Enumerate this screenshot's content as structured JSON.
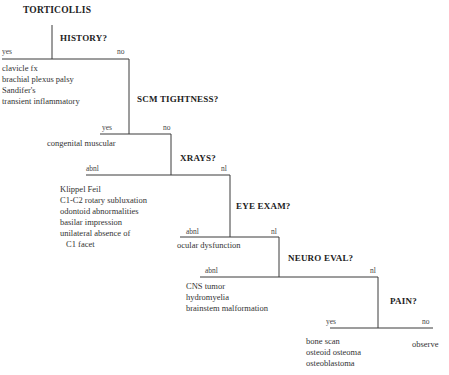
{
  "title": "TORTICOLLIS",
  "nodes": [
    {
      "question": "HISTORY?",
      "left_label": "yes",
      "right_label": "no",
      "left_outcomes": [
        "clavicle fx",
        "brachial plexus palsy",
        "Sandifer's",
        "transient inflammatory"
      ]
    },
    {
      "question": "SCM TIGHTNESS?",
      "left_label": "yes",
      "right_label": "no",
      "left_outcomes": [
        "congenital muscular"
      ]
    },
    {
      "question": "XRAYS?",
      "left_label": "abnl",
      "right_label": "nl",
      "left_outcomes": [
        "Klippel Feil",
        "C1-C2 rotary subluxation",
        "odontoid abnormalities",
        "basilar impression",
        "unilateral absence of",
        "C1 facet"
      ]
    },
    {
      "question": "EYE EXAM?",
      "left_label": "abnl",
      "right_label": "nl",
      "left_outcomes": [
        "ocular dysfunction"
      ]
    },
    {
      "question": "NEURO EVAL?",
      "left_label": "abnl",
      "right_label": "nl",
      "left_outcomes": [
        "CNS tumor",
        "hydromyelia",
        "brainstem malformation"
      ]
    },
    {
      "question": "PAIN?",
      "left_label": "yes",
      "right_label": "no",
      "left_outcomes": [
        "bone scan",
        "osteoid osteoma",
        "osteoblastoma"
      ],
      "right_outcomes": [
        "observe"
      ]
    }
  ],
  "colors": {
    "line": "#3a3a3a",
    "text": "#333333",
    "background": "#ffffff"
  }
}
